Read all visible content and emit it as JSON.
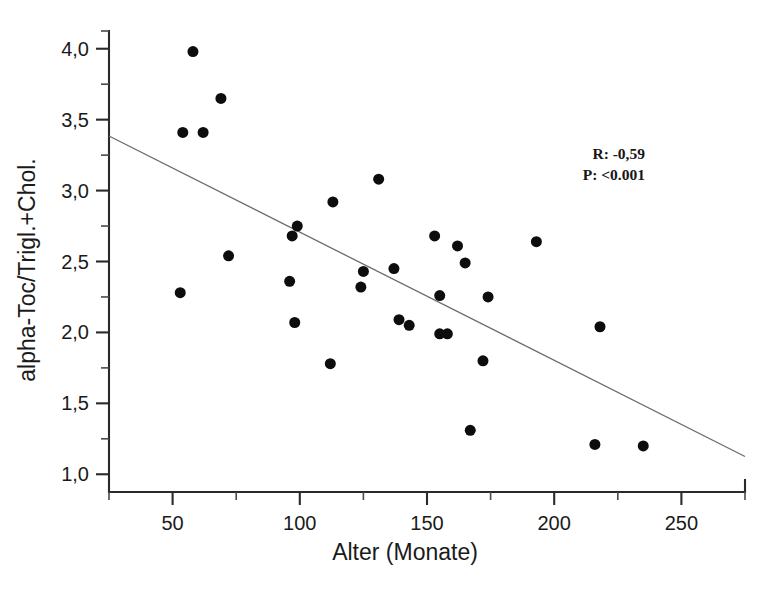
{
  "chart_data": {
    "type": "scatter",
    "title": "",
    "xlabel": "Alter (Monate)",
    "ylabel": "alpha-Toc/Trigl.+Chol.",
    "xlim": [
      25,
      275
    ],
    "ylim": [
      0.875,
      4.125
    ],
    "grid": false,
    "legend_position": "none",
    "x_ticks": [
      50,
      100,
      150,
      200,
      250
    ],
    "x_tick_labels": [
      "50",
      "100",
      "150",
      "200",
      "250"
    ],
    "x_minor_ticks": [
      25,
      75,
      125,
      175,
      225,
      275
    ],
    "y_ticks": [
      1.0,
      1.5,
      2.0,
      2.5,
      3.0,
      3.5,
      4.0
    ],
    "y_tick_labels": [
      "1,0",
      "1,5",
      "2,0",
      "2,5",
      "3,0",
      "3,5",
      "4,0"
    ],
    "y_minor_ticks": [
      1.25,
      1.75,
      2.25,
      2.75,
      3.25,
      3.75,
      4.125
    ],
    "marker": "filled-circle",
    "marker_color": "#0d0d0d",
    "marker_size_px": 11,
    "points": [
      {
        "x": 58,
        "y": 3.98
      },
      {
        "x": 69,
        "y": 3.65
      },
      {
        "x": 54,
        "y": 3.41
      },
      {
        "x": 62,
        "y": 3.41
      },
      {
        "x": 72,
        "y": 2.54
      },
      {
        "x": 53,
        "y": 2.28
      },
      {
        "x": 96,
        "y": 2.36
      },
      {
        "x": 98,
        "y": 2.07
      },
      {
        "x": 99,
        "y": 2.75
      },
      {
        "x": 97,
        "y": 2.68
      },
      {
        "x": 113,
        "y": 2.92
      },
      {
        "x": 112,
        "y": 1.78
      },
      {
        "x": 125,
        "y": 2.43
      },
      {
        "x": 124,
        "y": 2.32
      },
      {
        "x": 131,
        "y": 3.08
      },
      {
        "x": 137,
        "y": 2.45
      },
      {
        "x": 139,
        "y": 2.09
      },
      {
        "x": 143,
        "y": 2.05
      },
      {
        "x": 153,
        "y": 2.68
      },
      {
        "x": 155,
        "y": 2.26
      },
      {
        "x": 155,
        "y": 1.99
      },
      {
        "x": 158,
        "y": 1.99
      },
      {
        "x": 162,
        "y": 2.61
      },
      {
        "x": 165,
        "y": 2.49
      },
      {
        "x": 167,
        "y": 1.31
      },
      {
        "x": 172,
        "y": 1.8
      },
      {
        "x": 174,
        "y": 2.25
      },
      {
        "x": 193,
        "y": 2.64
      },
      {
        "x": 216,
        "y": 1.21
      },
      {
        "x": 218,
        "y": 2.04
      },
      {
        "x": 235,
        "y": 1.2
      }
    ],
    "regression_line": {
      "x_start": 25,
      "y_start": 3.385,
      "x_end": 275,
      "y_end": 1.125,
      "color": "#6b6b6b"
    },
    "annotations": [
      {
        "name": "correlation-coefficient",
        "text": "R: -0,59"
      },
      {
        "name": "p-value",
        "text": "P: <0.001"
      }
    ]
  }
}
